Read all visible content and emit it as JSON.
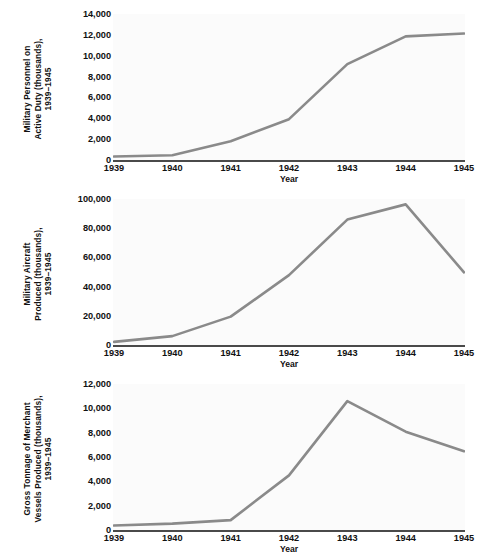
{
  "figure": {
    "background_color": "#ffffff",
    "line_color": "#8a8a8a",
    "axis_color": "#4a4a4a",
    "text_color": "#111111",
    "plot_background": "#fbfbfb"
  },
  "chart_data": [
    {
      "type": "line",
      "title": "",
      "ylabel": "Military Personnel on\nActive Duty (thousands),\n1939–1945",
      "xlabel": "Year",
      "categories": [
        "1939",
        "1940",
        "1941",
        "1942",
        "1943",
        "1944",
        "1945"
      ],
      "x": [
        1939,
        1940,
        1941,
        1942,
        1943,
        1944,
        1945
      ],
      "values": [
        334,
        458,
        1801,
        3915,
        9195,
        11858,
        12124
      ],
      "ylim": [
        0,
        14000
      ],
      "yticks": [
        0,
        2000,
        4000,
        6000,
        8000,
        10000,
        12000,
        14000
      ],
      "ytick_labels": [
        "0",
        "2,000",
        "4,000",
        "6,000",
        "8,000",
        "10,000",
        "12,000",
        "14,000"
      ],
      "grid": false,
      "legend": "none"
    },
    {
      "type": "line",
      "title": "",
      "ylabel": "Military Aircraft\nProduced (thousands),\n1939–1945",
      "xlabel": "Year",
      "categories": [
        "1939",
        "1940",
        "1941",
        "1942",
        "1943",
        "1944",
        "1945"
      ],
      "x": [
        1939,
        1940,
        1941,
        1942,
        1943,
        1944,
        1945
      ],
      "values": [
        2141,
        6086,
        19433,
        47836,
        85898,
        96318,
        49761
      ],
      "ylim": [
        0,
        100000
      ],
      "yticks": [
        0,
        20000,
        40000,
        60000,
        80000,
        100000
      ],
      "ytick_labels": [
        "0",
        "20,000",
        "40,000",
        "60,000",
        "80,000",
        "100,000"
      ],
      "grid": false,
      "legend": "none"
    },
    {
      "type": "line",
      "title": "",
      "ylabel": "Gross Tonnage of Merchant\nVessels Produced (thousands),\n1939–1945",
      "xlabel": "Year",
      "categories": [
        "1939",
        "1940",
        "1941",
        "1942",
        "1943",
        "1944",
        "1945"
      ],
      "x": [
        1939,
        1940,
        1941,
        1942,
        1943,
        1944,
        1945
      ],
      "values": [
        376,
        528,
        811,
        4490,
        10592,
        8080,
        6471
      ],
      "ylim": [
        0,
        12000
      ],
      "yticks": [
        0,
        2000,
        4000,
        6000,
        8000,
        10000,
        12000
      ],
      "ytick_labels": [
        "0",
        "2,000",
        "4,000",
        "6,000",
        "8,000",
        "10,000",
        "12,000"
      ],
      "grid": false,
      "legend": "none"
    }
  ]
}
